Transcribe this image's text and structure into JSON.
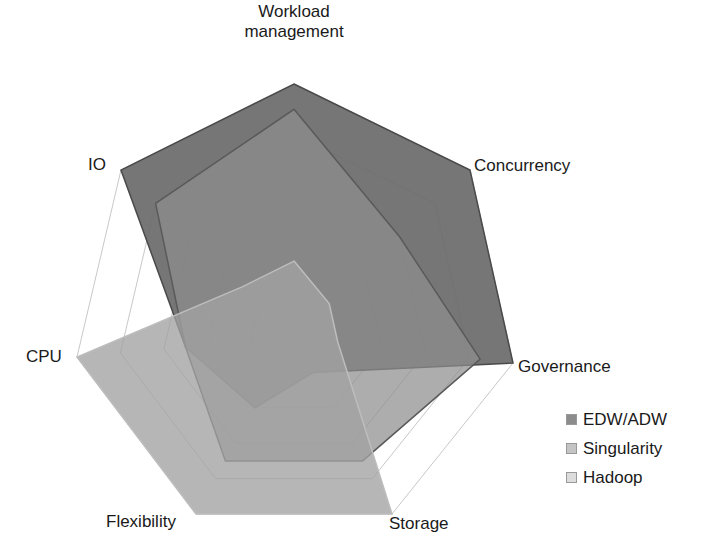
{
  "chart_data": {
    "type": "radar",
    "title": "",
    "axes": [
      "Workload management",
      "Concurrency",
      "Governance",
      "Storage",
      "Flexibility",
      "CPU",
      "IO"
    ],
    "range": [
      0,
      10
    ],
    "grid_rings": 5,
    "series": [
      {
        "name": "EDW/ADW",
        "values": [
          10,
          10,
          10,
          2,
          4,
          5,
          10
        ],
        "color": "#6e6e6e"
      },
      {
        "name": "Singularity",
        "values": [
          9,
          6,
          8.5,
          7,
          7,
          5,
          8
        ],
        "color": "#8a8a8a"
      },
      {
        "name": "Hadoop",
        "values": [
          3,
          2,
          2,
          10,
          10,
          10,
          3
        ],
        "color": "#a3a3a3"
      }
    ],
    "legend_position": "right-bottom"
  },
  "labels": {
    "workload_line1": "Workload",
    "workload_line2": "management",
    "concurrency": "Concurrency",
    "governance": "Governance",
    "storage": "Storage",
    "flexibility": "Flexibility",
    "cpu": "CPU",
    "io": "IO"
  },
  "legend": [
    {
      "label": "EDW/ADW",
      "color": "#8c8c8c"
    },
    {
      "label": "Singularity",
      "color": "#c4c4c4"
    },
    {
      "label": "Hadoop",
      "color": "#dcdcdc"
    }
  ]
}
